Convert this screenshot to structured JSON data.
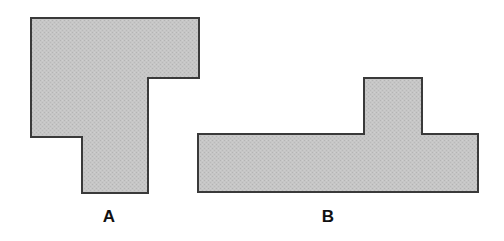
{
  "figure": {
    "background_color": "#ffffff",
    "fill_color": "#c4c4c4",
    "stroke_color": "#3a3a3a",
    "stroke_width": 2,
    "width": 504,
    "height": 241,
    "shapes": [
      {
        "id": "shape-a",
        "label": "A",
        "name": "L-shaped-polygon",
        "points": "31,18 199,18 199,78 148,78 148,193 82,193 82,137 31,137",
        "label_x": 109,
        "label_y": 218
      },
      {
        "id": "shape-b",
        "label": "B",
        "name": "T-shaped-polygon",
        "points": "364,78 422,78 422,134 478,134 478,192 198,192 198,134 364,134",
        "label_x": 328,
        "label_y": 218
      }
    ]
  },
  "labels": {
    "shape_a": "A",
    "shape_b": "B"
  }
}
